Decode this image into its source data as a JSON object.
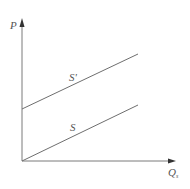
{
  "diagram": {
    "type": "supply-shift",
    "axes": {
      "y_label": "P",
      "x_label": "Q",
      "x_label_subscript": "s"
    },
    "curves": [
      {
        "name": "S'",
        "label": "S'",
        "start": [
          22,
          109
        ],
        "end": [
          138,
          54
        ]
      },
      {
        "name": "S",
        "label": "S",
        "start": [
          22,
          161
        ],
        "end": [
          138,
          105
        ]
      }
    ],
    "colors": {
      "axis": "#7a7a7a",
      "line": "#6e6e6e",
      "text": "#555555"
    }
  }
}
